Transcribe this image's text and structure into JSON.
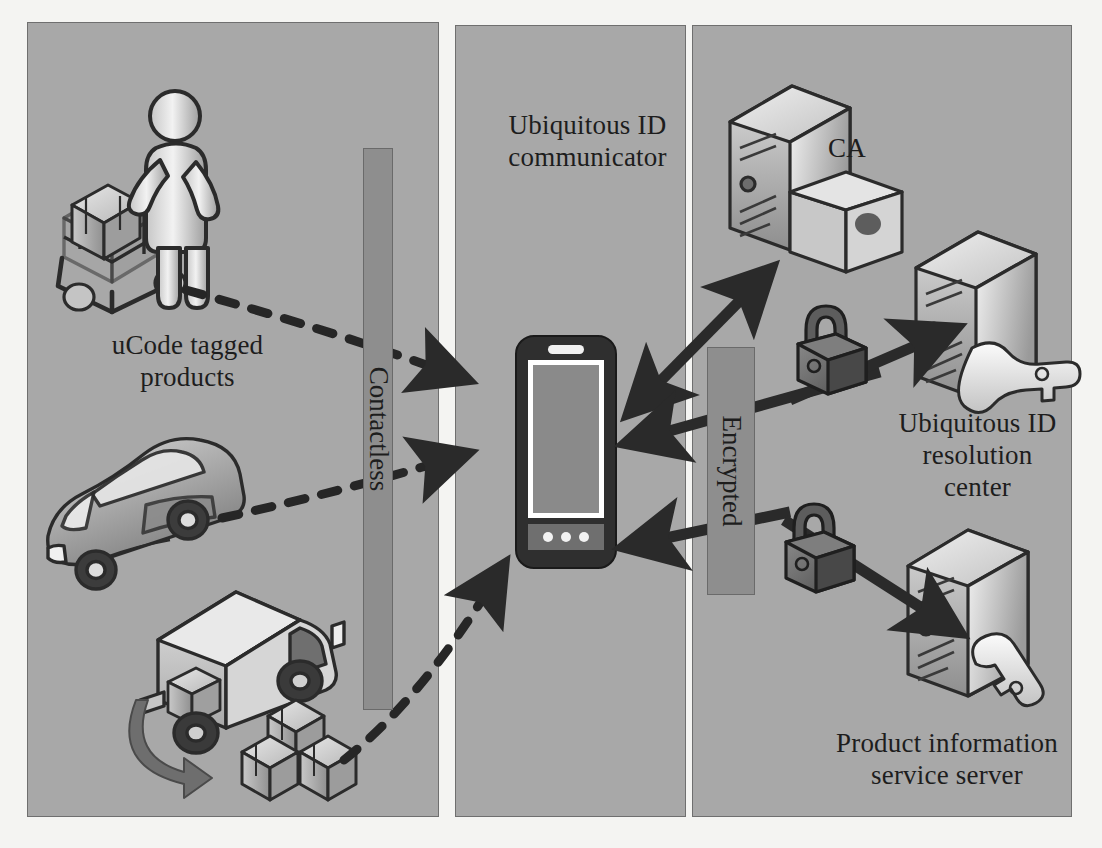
{
  "figure": {
    "background_color": "#f4f4f2",
    "panel_fill": "#a8a8a8",
    "panel_border": "#6f6f6f"
  },
  "panels": [
    {
      "id": "left",
      "name": "ucode-tagged-products-zone"
    },
    {
      "id": "middle",
      "name": "communicator-zone"
    },
    {
      "id": "right",
      "name": "server-infrastructure-zone"
    }
  ],
  "labels": {
    "ucode_products": "uCode tagged\nproducts",
    "ucode_products_line1": "uCode tagged",
    "ucode_products_line2": "products",
    "uid_communicator_line1": "Ubiquitous ID",
    "uid_communicator_line2": "communicator",
    "ca": "CA",
    "uid_resolution_line1": "Ubiquitous ID",
    "uid_resolution_line2": "resolution",
    "uid_resolution_line3": "center",
    "product_info_line1": "Product information",
    "product_info_line2": "service server"
  },
  "channel_bars": [
    {
      "id": "contactless",
      "label": "Contactless",
      "fill": "#8e8e8e"
    },
    {
      "id": "encrypted",
      "label": "Encrypted",
      "fill": "#8e8e8e"
    }
  ],
  "objects": {
    "shopping_cart": "shopping-cart-with-person-icon",
    "car": "car-icon",
    "truck": "delivery-truck-icon",
    "boxes": "stacked-boxes-icon",
    "smartphone": "smartphone-icon",
    "ca_server": "server-with-certificate-icon",
    "resolution_server": "server-with-key-icon",
    "product_server": "server-with-key-icon",
    "padlock_top": "padlock-icon",
    "padlock_bottom": "padlock-icon"
  },
  "connections": [
    {
      "from": "shopping-cart",
      "to": "smartphone",
      "style": "dashed",
      "arrow": "single",
      "channel": "Contactless"
    },
    {
      "from": "car",
      "to": "smartphone",
      "style": "dashed",
      "arrow": "single",
      "channel": "Contactless"
    },
    {
      "from": "boxes",
      "to": "smartphone",
      "style": "dashed",
      "arrow": "single",
      "channel": "Contactless"
    },
    {
      "from": "smartphone",
      "to": "ca-server",
      "style": "solid",
      "arrow": "double",
      "channel": ""
    },
    {
      "from": "resolution-center",
      "to": "smartphone",
      "style": "solid",
      "arrow": "single",
      "channel": "Encrypted"
    },
    {
      "from": "smartphone",
      "to": "resolution-center",
      "style": "solid",
      "arrow": "single",
      "channel": "Encrypted"
    },
    {
      "from": "smartphone",
      "to": "product-information-service-server",
      "style": "solid",
      "arrow": "single",
      "channel": "Encrypted"
    }
  ],
  "colors": {
    "panel": "#a8a8a8",
    "bar": "#8e8e8e",
    "arrow": "#2a2a2a",
    "text": "#1d1d1d",
    "device_body": "#2f2f2f",
    "device_screen": "#8a8a8a"
  }
}
